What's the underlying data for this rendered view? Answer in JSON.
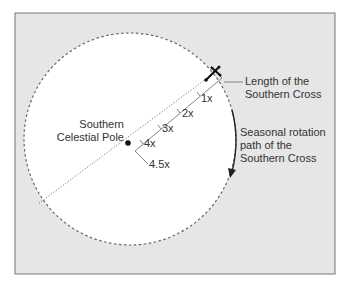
{
  "colors": {
    "background": "#e6e6e6",
    "sky_circle": "#ffffff",
    "border": "#777777",
    "line": "#333333",
    "text": "#333333"
  },
  "pole": {
    "label_line1": "Southern",
    "label_line2": "Celestial Pole"
  },
  "cross_label": {
    "line1": "Length of the",
    "line2": "Southern Cross"
  },
  "rotation_label": {
    "line1": "Seasonal rotation",
    "line2": "path of the",
    "line3": "Southern Cross"
  },
  "ruler_ticks": [
    {
      "label": "1x"
    },
    {
      "label": "2x"
    },
    {
      "label": "3x"
    },
    {
      "label": "4x"
    },
    {
      "label": "4.5x"
    }
  ]
}
